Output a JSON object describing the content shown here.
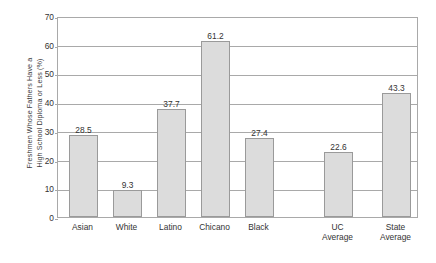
{
  "chart_data": {
    "type": "bar",
    "title": "",
    "subtitle": "",
    "xlabel": "",
    "ylabel": "Freshmen Whose Fathers Have a High School Diploma or Less (%)",
    "ylabel_lines": [
      "Freshmen Whose Fathers Have a",
      "High School Diploma or Less (%)"
    ],
    "categories": [
      "Asian",
      "White",
      "Latino",
      "Chicano",
      "Black",
      "UC Average",
      "State Average"
    ],
    "category_lines": [
      [
        "Asian"
      ],
      [
        "White"
      ],
      [
        "Latino"
      ],
      [
        "Chicano"
      ],
      [
        "Black"
      ],
      [
        "UC",
        "Average"
      ],
      [
        "State",
        "Average"
      ]
    ],
    "values": [
      28.5,
      9.3,
      37.7,
      61.2,
      27.4,
      22.6,
      43.3
    ],
    "value_labels": [
      "28.5",
      "9.3",
      "37.7",
      "61.2",
      "27.4",
      "22.6",
      "43.3"
    ],
    "ylim": [
      0,
      70
    ],
    "yticks": [
      0,
      10,
      20,
      30,
      40,
      50,
      60,
      70
    ],
    "ytick_labels": [
      "0",
      "10",
      "20",
      "30",
      "40",
      "50",
      "60",
      "70"
    ],
    "grid": true,
    "grid_axis": "y",
    "legend": false,
    "legend_position": "none",
    "colors": {
      "bar_fill": "#dcdcdc",
      "bar_border": "#9a9a9a",
      "gridline": "#a9a9a9",
      "axis": "#a9a9a9",
      "text": "#333333",
      "background": "#ffffff"
    }
  }
}
